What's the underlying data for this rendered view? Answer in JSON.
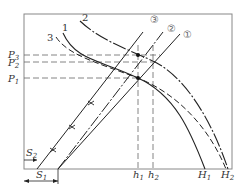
{
  "diagram": {
    "axes": {
      "frame_color": "#888888",
      "line_color": "#222222"
    },
    "y_labels": [
      {
        "main": "P",
        "sub": "3"
      },
      {
        "main": "P",
        "sub": "2"
      },
      {
        "main": "P",
        "sub": "1"
      }
    ],
    "x_labels": [
      {
        "main": "h",
        "sub": "1"
      },
      {
        "main": "h",
        "sub": "2"
      },
      {
        "main": "H",
        "sub": "1"
      },
      {
        "main": "H",
        "sub": "2"
      }
    ],
    "offset_labels": [
      {
        "main": "S",
        "sub": "2"
      },
      {
        "main": "S",
        "sub": "1"
      }
    ],
    "pump_curve_labels": [
      "1",
      "2",
      "3"
    ],
    "line_labels": [
      "①",
      "②",
      "③"
    ]
  }
}
